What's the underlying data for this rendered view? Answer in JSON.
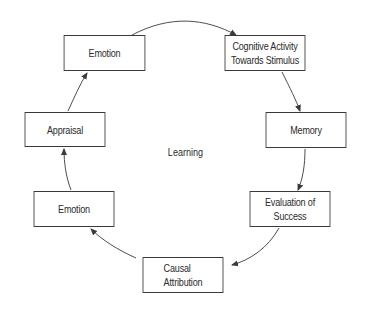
{
  "diagram": {
    "center_label": "Learning",
    "nodes": [
      {
        "id": "emotion-top",
        "label": "Emotion"
      },
      {
        "id": "cognitive-activity",
        "label": "Cognitive Activity\nTowards Stimulus"
      },
      {
        "id": "memory",
        "label": "Memory"
      },
      {
        "id": "evaluation",
        "label": "Evaluation of Success"
      },
      {
        "id": "causal-attribution",
        "label": "Causal\nAttribution"
      },
      {
        "id": "emotion-bottom",
        "label": "Emotion"
      },
      {
        "id": "appraisal",
        "label": "Appraisal"
      }
    ],
    "edges": [
      {
        "from": "emotion-top",
        "to": "cognitive-activity"
      },
      {
        "from": "cognitive-activity",
        "to": "memory"
      },
      {
        "from": "memory",
        "to": "evaluation"
      },
      {
        "from": "evaluation",
        "to": "causal-attribution"
      },
      {
        "from": "causal-attribution",
        "to": "emotion-bottom"
      },
      {
        "from": "emotion-bottom",
        "to": "appraisal"
      },
      {
        "from": "appraisal",
        "to": "emotion-top"
      }
    ],
    "colors": {
      "stroke": "#3a3a3a",
      "text": "#2a2a2a",
      "background": "#ffffff"
    }
  }
}
